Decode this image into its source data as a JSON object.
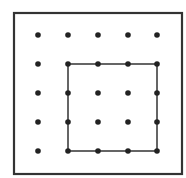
{
  "diagram": {
    "type": "geoboard",
    "grid": {
      "rows": 5,
      "cols": 5
    },
    "colors": {
      "border": "#333333",
      "dot": "#222222",
      "shape": "#333333",
      "background": "#ffffff"
    },
    "frame": {
      "x": 14,
      "y": 13,
      "width": 168,
      "height": 161
    },
    "dot_positions": {
      "x": [
        38,
        68,
        98,
        128,
        157
      ],
      "y": [
        35,
        64,
        93,
        122,
        151
      ]
    },
    "shape": {
      "name": "square",
      "grid_corners": [
        [
          1,
          1
        ],
        [
          4,
          1
        ],
        [
          4,
          4
        ],
        [
          1,
          4
        ]
      ]
    }
  }
}
